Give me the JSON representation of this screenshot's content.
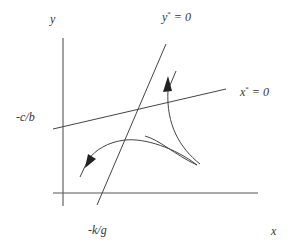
{
  "diagram": {
    "type": "phase-plane",
    "labels": {
      "y_axis": "y",
      "x_axis": "x",
      "y_nullcline_var": "y",
      "y_nullcline_rest": " = 0",
      "x_nullcline_var": "x",
      "x_nullcline_rest": " = 0",
      "star": "*",
      "y_intercept": "-c/b",
      "x_intercept": "-k/g"
    },
    "elements": [
      {
        "id": "y-axis",
        "kind": "axis",
        "label": "y"
      },
      {
        "id": "x-axis",
        "kind": "axis",
        "label": "x"
      },
      {
        "id": "y-nullcline",
        "kind": "line",
        "label": "y* = 0",
        "x_intercept": "-k/g"
      },
      {
        "id": "x-nullcline",
        "kind": "line",
        "label": "x* = 0",
        "y_intercept": "-c/b"
      },
      {
        "id": "trajectory-upper",
        "kind": "curve-with-arrow",
        "direction": "up"
      },
      {
        "id": "trajectory-lower",
        "kind": "curve-with-arrow",
        "direction": "down-left"
      }
    ],
    "colors": {
      "line": "#444444",
      "text": "#333333",
      "background": "#ffffff"
    }
  }
}
